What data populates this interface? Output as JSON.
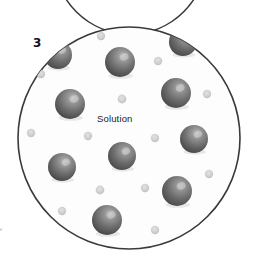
{
  "figure": {
    "panel_number": "3",
    "solution_label": "Solution",
    "edge_marginalia": "e",
    "background_color": "#ffffff"
  },
  "beaker": {
    "name": "solution-container",
    "outline_color": "#3a3a3a",
    "fill_color": "#fdfdfd",
    "stroke_width": 1.6,
    "cx": 129,
    "cy": 138,
    "r": 111
  },
  "upper_container": {
    "name": "upper-container-arc",
    "outline_color": "#3a3a3a",
    "stroke_width": 1.6,
    "cx": 130,
    "cy": -42,
    "r": 76
  },
  "legend": {
    "solute_particle_name": "solute-sphere",
    "solvent_particle_name": "solvent-dot",
    "solute_color_dark": "#4e4e4e",
    "solute_color_mid": "#7b7b7b",
    "solute_color_light": "#b9b9b9",
    "solvent_color": "#d2d2d2",
    "solvent_color_edge": "#bdbdbd"
  },
  "chart_data": {
    "type": "scatter",
    "title": "Solution",
    "xlabel": "",
    "ylabel": "",
    "xlim": [
      0,
      253
    ],
    "ylim": [
      0,
      265
    ],
    "grid": false,
    "legend_position": "none",
    "annotations": [
      {
        "text": "3",
        "x": 38,
        "y": 44
      },
      {
        "text": "Solution",
        "x": 122,
        "y": 120
      }
    ],
    "series": [
      {
        "name": "solute-spheres",
        "marker": "sphere",
        "radius": 14,
        "count": 11,
        "points": [
          {
            "x": 58,
            "y": 55,
            "r": 14
          },
          {
            "x": 120,
            "y": 62,
            "r": 15
          },
          {
            "x": 183,
            "y": 42,
            "r": 14
          },
          {
            "x": 70,
            "y": 104,
            "r": 15
          },
          {
            "x": 176,
            "y": 93,
            "r": 15
          },
          {
            "x": 194,
            "y": 139,
            "r": 14
          },
          {
            "x": 122,
            "y": 156,
            "r": 14
          },
          {
            "x": 62,
            "y": 167,
            "r": 14
          },
          {
            "x": 177,
            "y": 191,
            "r": 15
          },
          {
            "x": 107,
            "y": 220,
            "r": 15
          },
          {
            "x": 190,
            "y": 140,
            "r": 0
          }
        ]
      },
      {
        "name": "solvent-dots",
        "marker": "dot",
        "radius": 4,
        "count": 17,
        "points": [
          {
            "x": 101,
            "y": 36,
            "r": 4.2
          },
          {
            "x": 158,
            "y": 61,
            "r": 4.2
          },
          {
            "x": 41,
            "y": 74,
            "r": 4.2
          },
          {
            "x": 207,
            "y": 94,
            "r": 4.2
          },
          {
            "x": 122,
            "y": 99,
            "r": 4.4
          },
          {
            "x": 31,
            "y": 133,
            "r": 4.2
          },
          {
            "x": 88,
            "y": 136,
            "r": 4.2
          },
          {
            "x": 155,
            "y": 138,
            "r": 4.2
          },
          {
            "x": 145,
            "y": 188,
            "r": 4.2
          },
          {
            "x": 209,
            "y": 174,
            "r": 4.2
          },
          {
            "x": 100,
            "y": 190,
            "r": 4.4
          },
          {
            "x": 62,
            "y": 211,
            "r": 4.2
          },
          {
            "x": 144,
            "y": 190,
            "r": 0
          },
          {
            "x": 155,
            "y": 230,
            "r": 4.2
          },
          {
            "x": 189,
            "y": 228,
            "r": 0
          },
          {
            "x": 210,
            "y": 175,
            "r": 0
          },
          {
            "x": 47,
            "y": 192,
            "r": 0
          }
        ]
      }
    ]
  }
}
